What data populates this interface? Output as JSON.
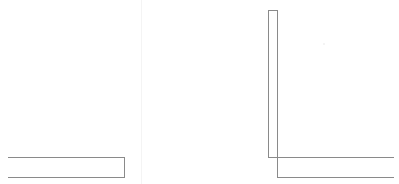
{
  "canvas": {
    "width": 399,
    "height": 184,
    "background": "#ffffff",
    "stroke": "#8a8a8a"
  },
  "left_panel": {
    "shape": "horizontal-bar-outline",
    "box": {
      "x": 8,
      "y": 157,
      "width": 117,
      "height": 21
    }
  },
  "right_panel": {
    "vertical_bar": {
      "x": 268,
      "y": 10,
      "width": 10,
      "height": 148
    },
    "upper_line": {
      "x": 268,
      "y": 157,
      "width": 126
    },
    "lower_line": {
      "x": 277,
      "y": 177,
      "width": 117
    },
    "connector": {
      "x": 277,
      "y": 157,
      "height": 21
    }
  }
}
